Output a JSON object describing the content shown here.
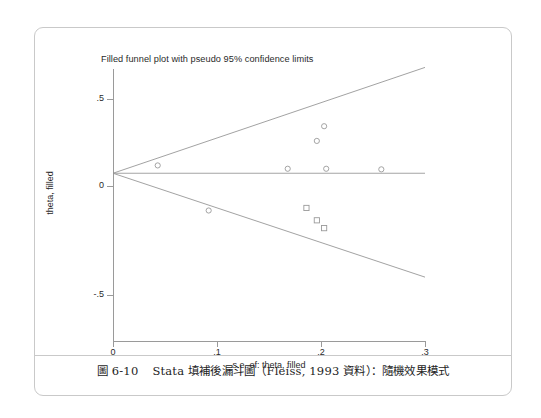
{
  "figure": {
    "caption_number": "圖 6-10",
    "caption_text": "Stata 填補後漏斗圖（Fleiss, 1993 資料）：隨機效果模式"
  },
  "chart_data": {
    "type": "scatter",
    "title": "Filled funnel plot with pseudo 95% confidence limits",
    "xlabel": "s.e. of: theta, filled",
    "ylabel": "theta, filled",
    "xlim": [
      0,
      0.3
    ],
    "ylim": [
      -0.5,
      0.5
    ],
    "xticks": [
      0,
      0.1,
      0.2,
      0.3
    ],
    "xticklabels": [
      "0",
      ".1",
      ".2",
      ".3"
    ],
    "yticks": [
      0.5,
      0,
      -0.5
    ],
    "yticklabels": [
      ".5",
      "0",
      "-.5"
    ],
    "grid": false,
    "legend": null,
    "pooled_effect": 0.065,
    "reference_line": {
      "name": "pooled-effect-line",
      "y": 0.065,
      "x_start": 0.0,
      "x_end": 0.3,
      "color": "#9a9a9a"
    },
    "confidence_limits": {
      "name": "pseudo-95-confidence-limits",
      "apex_x": 0.0,
      "apex_y": 0.065,
      "upper_end": {
        "x": 0.3,
        "y": 0.605
      },
      "lower_end": {
        "x": 0.3,
        "y": -0.465
      },
      "color": "#8a8a8a"
    },
    "series": [
      {
        "name": "observed studies",
        "marker": "open-circle",
        "color": "#9a9a9a",
        "points": [
          {
            "x": 0.043,
            "y": 0.105
          },
          {
            "x": 0.092,
            "y": -0.125
          },
          {
            "x": 0.168,
            "y": 0.088
          },
          {
            "x": 0.196,
            "y": 0.23
          },
          {
            "x": 0.203,
            "y": 0.305
          },
          {
            "x": 0.205,
            "y": 0.088
          },
          {
            "x": 0.258,
            "y": 0.085
          }
        ]
      },
      {
        "name": "filled (imputed) studies",
        "marker": "open-square",
        "color": "#9a9a9a",
        "points": [
          {
            "x": 0.186,
            "y": -0.112
          },
          {
            "x": 0.196,
            "y": -0.175
          },
          {
            "x": 0.203,
            "y": -0.215
          }
        ]
      }
    ]
  }
}
